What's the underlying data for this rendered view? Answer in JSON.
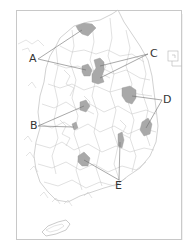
{
  "map": {
    "title": "",
    "labels": [
      {
        "id": "A",
        "text": "A",
        "x": 30,
        "y": 56
      },
      {
        "id": "B",
        "text": "B",
        "x": 31,
        "y": 122
      },
      {
        "id": "C",
        "text": "C",
        "x": 150,
        "y": 51
      },
      {
        "id": "D",
        "text": "D",
        "x": 163,
        "y": 96
      },
      {
        "id": "E",
        "text": "E",
        "x": 116,
        "y": 182
      }
    ],
    "colors": {
      "frame": "#c8c8c8",
      "border_lines": "#b4b4b4",
      "highlight_fill": "#a9a9a9",
      "leader_line": "#6e6e6e",
      "label_text": "#333333"
    },
    "inset": {
      "symbol": "□"
    }
  }
}
